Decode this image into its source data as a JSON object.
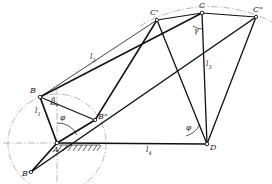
{
  "figure": {
    "type": "kinematic-diagram",
    "ink_color": "#1a1a1a",
    "centerline_color": "#8a8a8a",
    "background": "#ffffff"
  },
  "points": {
    "A": {
      "label": "A",
      "prime": "",
      "x": 57,
      "y": 143
    },
    "B": {
      "label": "B",
      "prime": "",
      "x": 40,
      "y": 97
    },
    "B2": {
      "label": "B",
      "prime": "\"",
      "x": 95,
      "y": 120
    },
    "B1": {
      "label": "B",
      "prime": "'",
      "x": 31,
      "y": 172
    },
    "C": {
      "label": "C",
      "prime": "",
      "x": 202,
      "y": 13
    },
    "C1": {
      "label": "C",
      "prime": "'",
      "x": 157,
      "y": 20
    },
    "C2": {
      "label": "C",
      "prime": "\"",
      "x": 256,
      "y": 17
    },
    "D": {
      "label": "D",
      "prime": "",
      "x": 207,
      "y": 144
    }
  },
  "lengths": [
    {
      "name": "l1",
      "base": "l",
      "sub": "1",
      "x": 37,
      "y": 112,
      "desc": "crank AB"
    },
    {
      "name": "l2",
      "base": "l",
      "sub": "2",
      "x": 92,
      "y": 58,
      "desc": "coupler BC"
    },
    {
      "name": "l3",
      "base": "l",
      "sub": "3",
      "x": 208,
      "y": 65,
      "desc": "rocker CD"
    },
    {
      "name": "l4",
      "base": "l",
      "sub": "4",
      "x": 148,
      "y": 148,
      "desc": "frame AD"
    }
  ],
  "angles": [
    {
      "name": "beta",
      "glyph": "β",
      "x": 52,
      "y": 101,
      "desc": "angle at B"
    },
    {
      "name": "phi_A",
      "glyph": "φ",
      "x": 62,
      "y": 119,
      "desc": "crank angle at A"
    },
    {
      "name": "gamma",
      "glyph": "γ",
      "x": 196,
      "y": 30,
      "desc": "transmission angle at C"
    },
    {
      "name": "phi_D",
      "glyph": "φ",
      "x": 190,
      "y": 128,
      "desc": "rocker angle at D"
    }
  ],
  "elements": {
    "crank_circle": "dash-dot circle traced by B about A",
    "coupler_arc": "dash-dot arc traced by C about D",
    "ground_hatch": "hatched ground symbol at A",
    "h_centerline": "horizontal dash-dot centerline through A",
    "v_centerline": "vertical dash-dot centerline through A",
    "links": [
      "A-B",
      "B-C",
      "C-D",
      "A-D",
      "A-B\"",
      "B\"-C'",
      "C'-D",
      "A-B'",
      "B'-C\"",
      "C\"-D",
      "B-B\"",
      "B\"-B'",
      "C-C'",
      "C-C\""
    ]
  }
}
